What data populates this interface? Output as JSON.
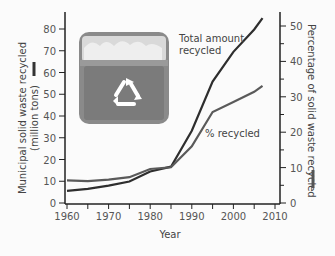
{
  "chart_data": {
    "type": "line",
    "title": "",
    "xlabel": "Year",
    "ylabel_left": "Municipal solid waste recycled (million tons)",
    "ylabel_right": "Percentage of solid waste recycled",
    "x_ticks": [
      1960,
      1970,
      1980,
      1990,
      2000,
      2010
    ],
    "y_left_ticks": [
      0,
      10,
      20,
      30,
      40,
      50,
      60,
      70,
      80
    ],
    "y_right_ticks": [
      0,
      10,
      20,
      30,
      40,
      50
    ],
    "xlim": [
      1960,
      2010
    ],
    "ylim_left": [
      0,
      85
    ],
    "ylim_right": [
      0,
      53
    ],
    "grid": false,
    "series": [
      {
        "name": "Total amount recycled",
        "axis": "left",
        "x": [
          1960,
          1965,
          1970,
          1975,
          1980,
          1985,
          1990,
          1995,
          2000,
          2005,
          2007
        ],
        "values": [
          5.6,
          6.5,
          8.0,
          9.9,
          14.5,
          16.7,
          33.2,
          55.8,
          69.5,
          79.8,
          85.0
        ]
      },
      {
        "name": "% recycled",
        "axis": "right",
        "x": [
          1960,
          1965,
          1970,
          1975,
          1980,
          1985,
          1990,
          1995,
          2000,
          2005,
          2007
        ],
        "values": [
          6.4,
          6.2,
          6.6,
          7.3,
          9.6,
          10.1,
          16.0,
          25.7,
          28.5,
          31.4,
          33.1
        ]
      }
    ],
    "annotations": [
      "Total amount recycled",
      "% recycled"
    ]
  },
  "labels": {
    "total": [
      "Total amount",
      "recycled"
    ],
    "pct": "% recycled",
    "ylabel_left_1": "Municipal solid waste recycled",
    "ylabel_left_2": "(million tons)",
    "ylabel_right": "Percentage of solid waste recycled",
    "xlabel": "Year"
  },
  "image": {
    "icon": "recycle-bin-photo"
  }
}
